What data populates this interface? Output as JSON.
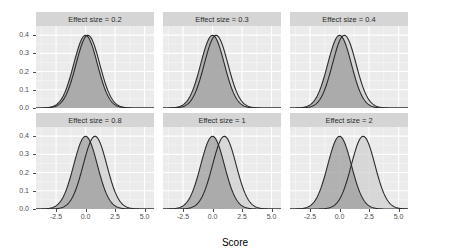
{
  "chart_data": {
    "type": "area",
    "title": "",
    "xlabel": "Score",
    "ylabel": "density",
    "xlim": [
      -4.2,
      5.8
    ],
    "ylim": [
      0,
      0.45
    ],
    "xticks": [
      "-2.5",
      "0.0",
      "2.5",
      "5.0"
    ],
    "xtick_values": [
      -2.5,
      0.0,
      2.5,
      5.0
    ],
    "yticks": [
      "0.0",
      "0.1",
      "0.2",
      "0.3",
      "0.4"
    ],
    "ytick_values": [
      0.0,
      0.1,
      0.2,
      0.3,
      0.4
    ],
    "grid": true,
    "legend": "none",
    "facet_layout": {
      "rows": 2,
      "cols": 3
    },
    "series_names": [
      "control",
      "treatment"
    ],
    "colors": {
      "panel_background": "#ebebeb",
      "strip_background": "#d5d5d5",
      "grid_major": "#ffffff",
      "grid_minor": "#f5f5f5",
      "control_fill": "#9a9a9a",
      "treatment_fill": "#cfcfcf",
      "curve_line": "#2b2b2b",
      "axis_text": "#4d4d4d"
    },
    "panels": [
      {
        "title": "Effect size = 0.2",
        "effect_size": 0.2,
        "curves": [
          {
            "name": "control",
            "mean": 0.0,
            "sd": 1.0,
            "peak": 0.399
          },
          {
            "name": "treatment",
            "mean": 0.2,
            "sd": 1.0,
            "peak": 0.399
          }
        ]
      },
      {
        "title": "Effect size = 0.3",
        "effect_size": 0.3,
        "curves": [
          {
            "name": "control",
            "mean": 0.0,
            "sd": 1.0,
            "peak": 0.399
          },
          {
            "name": "treatment",
            "mean": 0.3,
            "sd": 1.0,
            "peak": 0.399
          }
        ]
      },
      {
        "title": "Effect size = 0.4",
        "effect_size": 0.4,
        "curves": [
          {
            "name": "control",
            "mean": 0.0,
            "sd": 1.0,
            "peak": 0.399
          },
          {
            "name": "treatment",
            "mean": 0.4,
            "sd": 1.0,
            "peak": 0.399
          }
        ]
      },
      {
        "title": "Effect size = 0.8",
        "effect_size": 0.8,
        "curves": [
          {
            "name": "control",
            "mean": 0.0,
            "sd": 1.0,
            "peak": 0.399
          },
          {
            "name": "treatment",
            "mean": 0.8,
            "sd": 1.0,
            "peak": 0.399
          }
        ]
      },
      {
        "title": "Effect size = 1",
        "effect_size": 1,
        "curves": [
          {
            "name": "control",
            "mean": 0.0,
            "sd": 1.0,
            "peak": 0.399
          },
          {
            "name": "treatment",
            "mean": 1.0,
            "sd": 1.0,
            "peak": 0.399
          }
        ]
      },
      {
        "title": "Effect size = 2",
        "effect_size": 2,
        "curves": [
          {
            "name": "control",
            "mean": 0.0,
            "sd": 1.0,
            "peak": 0.399
          },
          {
            "name": "treatment",
            "mean": 2.0,
            "sd": 1.0,
            "peak": 0.399
          }
        ]
      }
    ]
  }
}
